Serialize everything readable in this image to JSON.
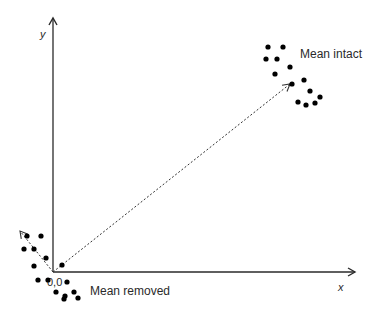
{
  "diagram": {
    "axes": {
      "x_label": "x",
      "y_label": "y",
      "origin_label": "0,0"
    },
    "labels": {
      "mean_intact": "Mean intact",
      "mean_removed": "Mean removed"
    },
    "colors": {
      "axis": "#2a2a2a",
      "points": "#000000",
      "vector": "#333333"
    },
    "clusters": {
      "intact": [
        [
          268,
          47
        ],
        [
          283,
          47
        ],
        [
          266,
          59
        ],
        [
          277,
          59
        ],
        [
          290,
          67
        ],
        [
          275,
          74
        ],
        [
          304,
          80
        ],
        [
          292,
          84
        ],
        [
          310,
          91
        ],
        [
          298,
          102
        ],
        [
          306,
          105
        ],
        [
          315,
          103
        ],
        [
          320,
          97
        ]
      ],
      "removed": [
        [
          27,
          236
        ],
        [
          41,
          236
        ],
        [
          24,
          249
        ],
        [
          34,
          249
        ],
        [
          46,
          258
        ],
        [
          34,
          266
        ],
        [
          62,
          265
        ],
        [
          48,
          280
        ],
        [
          38,
          280
        ],
        [
          67,
          282
        ],
        [
          56,
          292
        ],
        [
          65,
          296
        ],
        [
          74,
          292
        ],
        [
          78,
          298
        ],
        [
          64,
          299
        ]
      ]
    }
  }
}
